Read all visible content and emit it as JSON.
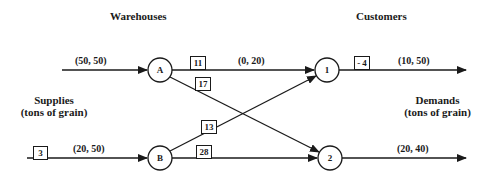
{
  "headers": {
    "warehouses": "Warehouses",
    "customers": "Customers"
  },
  "side_labels": {
    "supplies_line1": "Supplies",
    "supplies_line2": "(tons of grain)",
    "demands_line1": "Demands",
    "demands_line2": "(tons of grain)"
  },
  "nodes": {
    "A": "A",
    "B": "B",
    "c1": "1",
    "c2": "2"
  },
  "edges": {
    "supply_A": {
      "bounds": "(50, 50)",
      "cost": ""
    },
    "supply_B": {
      "bounds": "(20, 50)",
      "cost": "3"
    },
    "A_1": {
      "bounds": "(0, 20)",
      "cost": "11"
    },
    "A_2": {
      "bounds": "",
      "cost": "17"
    },
    "B_1": {
      "bounds": "",
      "cost": "13"
    },
    "B_2": {
      "bounds": "",
      "cost": "28"
    },
    "demand_1": {
      "bounds": "(10, 50)",
      "cost": "- 4"
    },
    "demand_2": {
      "bounds": "(20, 40)",
      "cost": ""
    }
  },
  "colors": {
    "line": "#1a1a1a",
    "background": "#ffffff"
  }
}
